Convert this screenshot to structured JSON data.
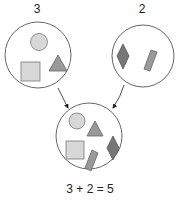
{
  "diagram": {
    "left_set": {
      "count_label": "3",
      "shapes": [
        "circle",
        "square",
        "triangle"
      ]
    },
    "right_set": {
      "count_label": "2",
      "shapes": [
        "diamond",
        "rectangle"
      ]
    },
    "result_set": {
      "shapes": [
        "circle",
        "triangle",
        "square",
        "diamond",
        "rectangle"
      ]
    },
    "equation": "3 + 2 = 5",
    "colors": {
      "outline": "#555555",
      "light_fill": "#d6d6d6",
      "mid_fill": "#8e8e8e",
      "dark_fill": "#6f6f6f"
    }
  }
}
